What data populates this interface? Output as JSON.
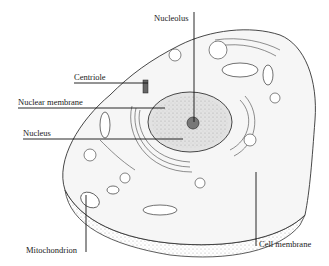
{
  "diagram": {
    "colors": {
      "line": "#2a2a2a",
      "fill": "#f4f4f4",
      "shade": "#bdbdbd",
      "background": "#ffffff"
    },
    "labels": [
      {
        "id": "nucleolus",
        "text": "Nucleolus"
      },
      {
        "id": "centriole",
        "text": "Centriole"
      },
      {
        "id": "nuclear-membrane",
        "text": "Nuclear membrane"
      },
      {
        "id": "nucleus",
        "text": "Nucleus"
      },
      {
        "id": "mitochondrion",
        "text": "Mitochondrion"
      },
      {
        "id": "cell-membrane",
        "text": "Cell membrane"
      }
    ]
  }
}
